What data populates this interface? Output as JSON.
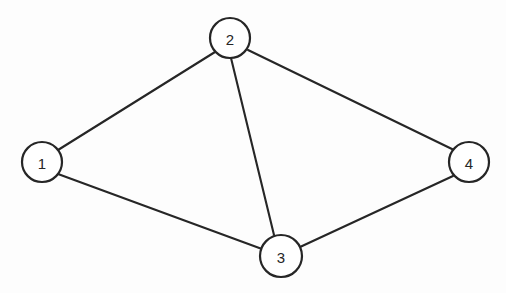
{
  "diagram": {
    "type": "undirected-graph",
    "title": "",
    "canvas": {
      "width": 506,
      "height": 293
    },
    "colors": {
      "background": "#fdfdfd",
      "stroke": "#262626",
      "node_fill": "#ffffff",
      "label": "#262626"
    },
    "stroke_widths": {
      "edge": 2.1,
      "node": 2.2
    },
    "nodes": [
      {
        "id": "1",
        "label": "1",
        "cx": 42,
        "cy": 162,
        "r": 20
      },
      {
        "id": "2",
        "label": "2",
        "cx": 230,
        "cy": 38,
        "r": 20
      },
      {
        "id": "3",
        "label": "3",
        "cx": 281,
        "cy": 256,
        "r": 21
      },
      {
        "id": "4",
        "label": "4",
        "cx": 469,
        "cy": 162,
        "r": 20
      }
    ],
    "edges": [
      {
        "id": "e12",
        "from": "1",
        "to": "2",
        "x1": 58,
        "y1": 150,
        "x2": 215,
        "y2": 52
      },
      {
        "id": "e13",
        "from": "1",
        "to": "3",
        "x1": 58,
        "y1": 174,
        "x2": 262,
        "y2": 249
      },
      {
        "id": "e23",
        "from": "2",
        "to": "3",
        "x1": 231,
        "y1": 58,
        "x2": 274,
        "y2": 235
      },
      {
        "id": "e24",
        "from": "2",
        "to": "4",
        "x1": 248,
        "y1": 50,
        "x2": 454,
        "y2": 150
      },
      {
        "id": "e34",
        "from": "3",
        "to": "4",
        "x1": 300,
        "y1": 247,
        "x2": 453,
        "y2": 176
      }
    ],
    "node_count": 4,
    "edge_count": 5
  }
}
